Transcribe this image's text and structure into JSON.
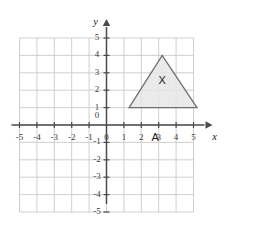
{
  "chart_data": {
    "type": "scatter",
    "title": "",
    "xlabel": "x",
    "ylabel": "y",
    "xlim": [
      -5,
      5
    ],
    "ylim": [
      -5,
      5
    ],
    "grid": true,
    "legend": null,
    "x_ticks": [
      -5,
      -4,
      -3,
      -2,
      -1,
      0,
      1,
      2,
      3,
      4,
      5
    ],
    "y_ticks": [
      -5,
      -4,
      -3,
      -2,
      -1,
      0,
      1,
      2,
      3,
      4,
      5
    ],
    "x_tick_labels": [
      "-5",
      "-4",
      "-3",
      "-2",
      "-1",
      "0",
      "1",
      "2",
      "3",
      "4",
      "5"
    ],
    "y_tick_labels": [
      "-5",
      "-4",
      "-3",
      "-2",
      "-1",
      "0",
      "1",
      "2",
      "3",
      "4",
      "5"
    ],
    "origin_label": "0",
    "shapes": [
      {
        "name": "triangle-x",
        "label": "X",
        "kind": "polygon",
        "vertices": [
          [
            1.3,
            1
          ],
          [
            5.2,
            1
          ],
          [
            3.2,
            4
          ]
        ],
        "label_position": [
          3.2,
          2.5
        ],
        "fill": "#e6e6e6",
        "stroke": "#6e6e6e"
      }
    ],
    "annotations": [
      {
        "name": "point-a",
        "text": "A",
        "position": [
          2.8,
          -0.75
        ]
      }
    ]
  },
  "axes": {
    "x_axis_name": "x",
    "y_axis_name": "y"
  }
}
